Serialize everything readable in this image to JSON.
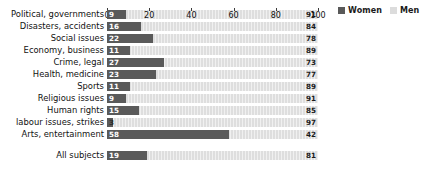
{
  "legend": {
    "position": "top-right",
    "entries": [
      {
        "label": "Women",
        "color": "#5a5a5a"
      },
      {
        "label": "Men",
        "color": "#dcdcdc"
      }
    ]
  },
  "axis": {
    "ticks": [
      "0",
      "20",
      "40",
      "60",
      "80",
      "100"
    ]
  },
  "chart_data": {
    "type": "bar",
    "title": "",
    "subtitle": "",
    "xlabel": "",
    "ylabel": "",
    "orientation": "horizontal",
    "stacked": true,
    "stack_total": 100,
    "grid": false,
    "legend_position": "top-right",
    "xlim": [
      0,
      100
    ],
    "xticks": [
      0,
      20,
      40,
      60,
      80,
      100
    ],
    "categories": [
      "Political, governments",
      "Disasters, accidents",
      "Social issues",
      "Economy, business",
      "Crime, legal",
      "Health, medicine",
      "Sports",
      "Religious issues",
      "Human rights",
      "labour issues, strikes",
      "Arts, entertainment"
    ],
    "summary_category": "All subjects",
    "series": [
      {
        "name": "Women",
        "color": "#5a5a5a",
        "values": [
          9,
          16,
          22,
          11,
          27,
          23,
          11,
          9,
          15,
          3,
          58
        ],
        "summary_value": 19
      },
      {
        "name": "Men",
        "color": "#dcdcdc",
        "values": [
          91,
          84,
          78,
          89,
          73,
          77,
          89,
          91,
          85,
          97,
          42
        ],
        "summary_value": 81
      }
    ]
  },
  "rows": [
    {
      "label": "Political, governments",
      "women": 9,
      "men": 91,
      "women_label": "9",
      "men_label": "91"
    },
    {
      "label": "Disasters, accidents",
      "women": 16,
      "men": 84,
      "women_label": "16",
      "men_label": "84"
    },
    {
      "label": "Social issues",
      "women": 22,
      "men": 78,
      "women_label": "22",
      "men_label": "78"
    },
    {
      "label": "Economy, business",
      "women": 11,
      "men": 89,
      "women_label": "11",
      "men_label": "89"
    },
    {
      "label": "Crime, legal",
      "women": 27,
      "men": 73,
      "women_label": "27",
      "men_label": "73"
    },
    {
      "label": "Health, medicine",
      "women": 23,
      "men": 77,
      "women_label": "23",
      "men_label": "77"
    },
    {
      "label": "Sports",
      "women": 11,
      "men": 89,
      "women_label": "11",
      "men_label": "89"
    },
    {
      "label": "Religious issues",
      "women": 9,
      "men": 91,
      "women_label": "9",
      "men_label": "91"
    },
    {
      "label": "Human rights",
      "women": 15,
      "men": 85,
      "women_label": "15",
      "men_label": "85"
    },
    {
      "label": "labour issues, strikes",
      "women": 3,
      "men": 97,
      "women_label": "3",
      "men_label": "97"
    },
    {
      "label": "Arts, entertainment",
      "women": 58,
      "men": 42,
      "women_label": "58",
      "men_label": "42"
    }
  ],
  "summary_row": {
    "label": "All subjects",
    "women": 19,
    "men": 81,
    "women_label": "19",
    "men_label": "81"
  }
}
